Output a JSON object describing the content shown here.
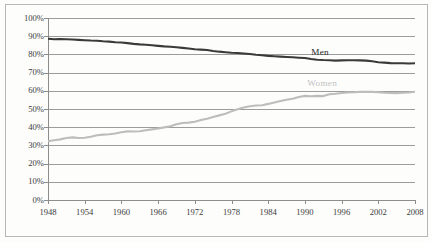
{
  "chart_data": {
    "type": "line",
    "title": "",
    "subtitle": "",
    "xlabel": "",
    "ylabel": "",
    "xlim": [
      1948,
      2008
    ],
    "ylim": [
      0,
      100
    ],
    "grid": true,
    "legend_position": "inline-labels",
    "y_tick_labels": [
      "0%",
      "10%",
      "20%",
      "30%",
      "40%",
      "50%",
      "60%",
      "70%",
      "80%",
      "90%",
      "100%"
    ],
    "y_tick_values": [
      0,
      10,
      20,
      30,
      40,
      50,
      60,
      70,
      80,
      90,
      100
    ],
    "x_tick_labels": [
      "1948",
      "1954",
      "1960",
      "1966",
      "1972",
      "1978",
      "1984",
      "1990",
      "1996",
      "2002",
      "2008"
    ],
    "x_tick_values": [
      1948,
      1954,
      1960,
      1966,
      1972,
      1978,
      1984,
      1990,
      1996,
      2002,
      2008
    ],
    "x": [
      1948,
      1949,
      1950,
      1951,
      1952,
      1953,
      1954,
      1955,
      1956,
      1957,
      1958,
      1959,
      1960,
      1961,
      1962,
      1963,
      1964,
      1965,
      1966,
      1967,
      1968,
      1969,
      1970,
      1971,
      1972,
      1973,
      1974,
      1975,
      1976,
      1977,
      1978,
      1979,
      1980,
      1981,
      1982,
      1983,
      1984,
      1985,
      1986,
      1987,
      1988,
      1989,
      1990,
      1991,
      1992,
      1993,
      1994,
      1995,
      1996,
      1997,
      1998,
      1999,
      2000,
      2001,
      2002,
      2003,
      2004,
      2005,
      2006,
      2007,
      2008
    ],
    "series": [
      {
        "name": "Men",
        "color": "#3a3a3a",
        "label_x": 1993,
        "label_y": 81,
        "values": [
          88.6,
          88.3,
          88.4,
          88.3,
          88.2,
          88.0,
          87.8,
          87.6,
          87.5,
          87.2,
          87.0,
          86.7,
          86.5,
          86.2,
          85.8,
          85.5,
          85.3,
          85.0,
          84.7,
          84.4,
          84.2,
          83.9,
          83.6,
          83.2,
          82.8,
          82.6,
          82.4,
          81.9,
          81.5,
          81.2,
          80.9,
          80.8,
          80.5,
          80.2,
          79.8,
          79.5,
          79.2,
          79.0,
          78.8,
          78.6,
          78.4,
          78.2,
          78.0,
          77.5,
          77.1,
          76.9,
          76.8,
          76.6,
          76.7,
          76.8,
          76.8,
          76.7,
          76.6,
          76.2,
          75.7,
          75.5,
          75.2,
          75.1,
          75.1,
          75.0,
          75.1
        ],
        "start_value": 88.6,
        "end_value": 75.1
      },
      {
        "name": "Women",
        "color": "#bdbdbd",
        "label_x": 1993,
        "label_y": 64,
        "values": [
          32.3,
          32.8,
          33.3,
          34.1,
          34.4,
          34.1,
          34.2,
          34.8,
          35.6,
          35.9,
          36.1,
          36.5,
          37.2,
          37.7,
          37.6,
          37.8,
          38.3,
          38.8,
          39.3,
          39.9,
          40.5,
          41.6,
          42.3,
          42.5,
          43.0,
          43.9,
          44.7,
          45.6,
          46.5,
          47.4,
          48.7,
          49.8,
          50.8,
          51.5,
          51.9,
          52.1,
          52.8,
          53.6,
          54.4,
          55.1,
          55.6,
          56.6,
          57.2,
          57.0,
          57.2,
          57.1,
          58.1,
          58.4,
          58.8,
          59.1,
          59.2,
          59.4,
          59.5,
          59.4,
          59.2,
          58.9,
          58.8,
          58.7,
          58.9,
          59.1,
          59.5
        ],
        "start_value": 32.3,
        "end_value": 59.5
      }
    ]
  }
}
